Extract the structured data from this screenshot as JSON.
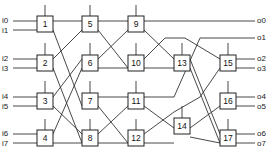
{
  "diagram": {
    "type": "switching network",
    "inputs": [
      "i0",
      "i1",
      "i2",
      "i3",
      "i4",
      "i5",
      "i6",
      "i7"
    ],
    "outputs": [
      "o0",
      "o1",
      "o2",
      "o3",
      "o4",
      "o5",
      "o6",
      "o7"
    ],
    "nodes": [
      "1",
      "2",
      "3",
      "4",
      "5",
      "6",
      "7",
      "8",
      "9",
      "10",
      "11",
      "12",
      "13",
      "14",
      "15",
      "16",
      "17"
    ]
  }
}
